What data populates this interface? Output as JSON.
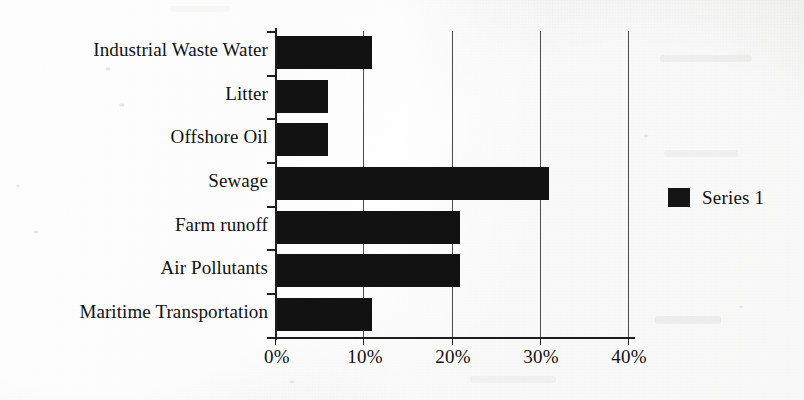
{
  "chart_data": {
    "type": "bar",
    "orientation": "horizontal",
    "title": "",
    "xlabel": "",
    "ylabel": "",
    "categories": [
      "Industrial Waste Water",
      "Litter",
      "Offshore Oil",
      "Sewage",
      "Farm runoff",
      "Air Pollutants",
      "Maritime Transportation"
    ],
    "series": [
      {
        "name": "Series 1",
        "values": [
          11,
          6,
          6,
          31,
          21,
          21,
          11
        ]
      }
    ],
    "xlim": [
      0,
      40
    ],
    "xtick_labels": [
      "0%",
      "10%",
      "20%",
      "30%",
      "40%"
    ],
    "xtick_values": [
      0,
      10,
      20,
      30,
      40
    ],
    "value_unit": "%",
    "grid": "vertical",
    "legend_position": "right",
    "bar_color": "#121212",
    "axis_color": "#1d1d1d",
    "gridline_color": "#4a4a4a",
    "background_color": "#efefed"
  },
  "legend": {
    "entries": [
      {
        "label": "Series 1",
        "color": "#151515"
      }
    ]
  }
}
